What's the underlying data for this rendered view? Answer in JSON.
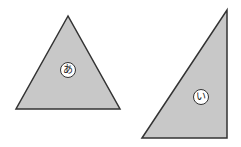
{
  "figure": {
    "shapes": [
      {
        "label": "あ",
        "type": "isosceles-triangle",
        "vertices": [
          [
            68,
            16
          ],
          [
            16,
            109
          ],
          [
            120,
            109
          ]
        ],
        "fill": "#c8c8c8"
      },
      {
        "label": "い",
        "type": "right-triangle",
        "vertices": [
          [
            142,
            138
          ],
          [
            227,
            10
          ],
          [
            227,
            138
          ]
        ],
        "fill": "#c8c8c8"
      }
    ],
    "stroke": "#333333"
  }
}
